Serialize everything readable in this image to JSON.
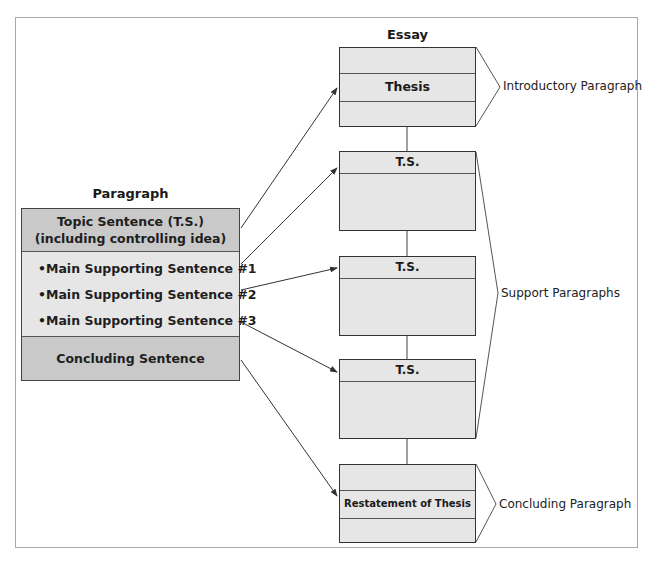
{
  "diagram": {
    "paragraph": {
      "title": "Paragraph",
      "topic_sentence_line1": "Topic Sentence (T.S.)",
      "topic_sentence_line2": "(including controlling idea)",
      "supporting": [
        "•Main Supporting Sentence #1",
        "•Main Supporting Sentence #2",
        "•Main Supporting Sentence #3"
      ],
      "concluding": "Concluding Sentence"
    },
    "essay": {
      "title": "Essay",
      "boxes": [
        {
          "label": "Thesis"
        },
        {
          "label": "T.S."
        },
        {
          "label": "T.S."
        },
        {
          "label": "T.S."
        },
        {
          "label": "Restatement of Thesis"
        }
      ]
    },
    "brackets": {
      "introductory": "Introductory Paragraph",
      "support": "Support Paragraphs",
      "concluding": "Concluding Paragraph"
    },
    "colors": {
      "dark_fill": "#c9c9c9",
      "light_fill": "#e6e6e6",
      "stroke": "#333333",
      "frame": "#a8a8a8"
    }
  }
}
